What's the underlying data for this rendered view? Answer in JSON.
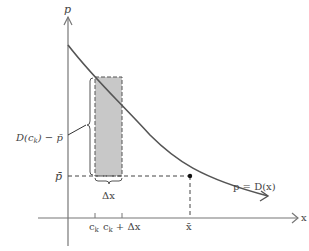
{
  "diagram": {
    "type": "demand-curve-consumer-surplus",
    "axes": {
      "y_label": "p",
      "x_label": "x"
    },
    "curve": {
      "label": "p = D(x)"
    },
    "labels": {
      "p_bar": "p̄",
      "x_bar": "x̄",
      "delta_x": "Δx",
      "ck": "c",
      "ck_sub": "k",
      "ck_plus": "c",
      "ck_plus_sub": "k",
      "ck_plus_rest": "+ Δx",
      "height_label_prefix": "D(c",
      "height_label_sub": "k",
      "height_label_suffix": ") − p̄"
    },
    "colors": {
      "curve": "#555555",
      "axes": "#777777",
      "rect_fill": "#c8c8c8",
      "dashed": "#444444",
      "text": "#444444"
    }
  }
}
